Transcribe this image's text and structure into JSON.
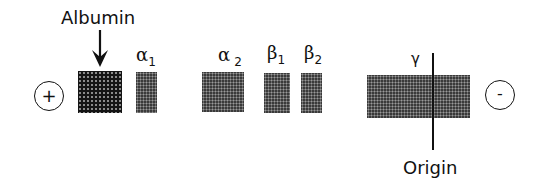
{
  "diagram": {
    "type": "serum protein electrophoresis",
    "labels": {
      "albumin": "Albumin",
      "origin": "Origin"
    },
    "electrodes": {
      "anode": "+",
      "cathode": "-"
    },
    "bands": [
      {
        "id": "albumin",
        "symbol": "",
        "sub": ""
      },
      {
        "id": "alpha1",
        "symbol": "α",
        "sub": "1"
      },
      {
        "id": "alpha2",
        "symbol": "α",
        "sub": "2"
      },
      {
        "id": "beta1",
        "symbol": "β",
        "sub": "1"
      },
      {
        "id": "beta2",
        "symbol": "β",
        "sub": "2"
      },
      {
        "id": "gamma",
        "symbol": "γ",
        "sub": ""
      }
    ],
    "colors": {
      "band_dark": "#141414",
      "band": "#3a3a3a",
      "line": "#111111",
      "background": "#ffffff"
    }
  }
}
